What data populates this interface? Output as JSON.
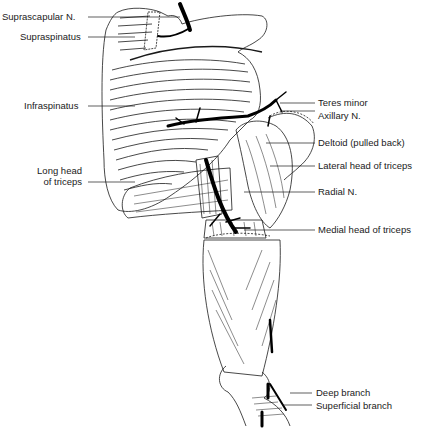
{
  "figure": {
    "labels_left": [
      {
        "id": "suprascapular-n",
        "text": "Suprascapular N."
      },
      {
        "id": "supraspinatus",
        "text": "Supraspinatus"
      },
      {
        "id": "infraspinatus",
        "text": "Infraspinatus"
      },
      {
        "id": "long-head-triceps-1",
        "text": "Long head"
      },
      {
        "id": "long-head-triceps-2",
        "text": "of triceps"
      }
    ],
    "labels_right": [
      {
        "id": "teres-minor",
        "text": "Teres minor"
      },
      {
        "id": "axillary-n",
        "text": "Axillary N."
      },
      {
        "id": "deltoid",
        "text": "Deltoid (pulled back)"
      },
      {
        "id": "lateral-head-triceps",
        "text": "Lateral head of triceps"
      },
      {
        "id": "radial-n",
        "text": "Radial N."
      },
      {
        "id": "medial-head-triceps",
        "text": "Medial head of triceps"
      },
      {
        "id": "deep-branch",
        "text": "Deep branch"
      },
      {
        "id": "superficial-branch",
        "text": "Superficial branch"
      }
    ],
    "colors": {
      "ink": "#1a1a1a",
      "nerve": "#000000",
      "background": "#ffffff"
    }
  }
}
